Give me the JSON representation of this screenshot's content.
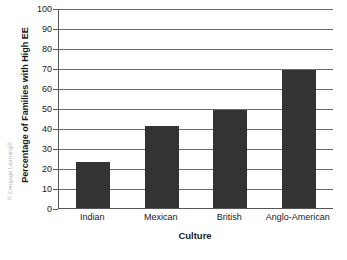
{
  "figure": {
    "credit": "© Cengage Learning®",
    "bar_color": "#333333",
    "gridline_color": "#6b6b6b",
    "axis_color": "#555555",
    "background": "#ffffff"
  },
  "chart_data": {
    "type": "bar",
    "title": "",
    "xlabel": "Culture",
    "ylabel": "Percentage of Families with High EE",
    "categories": [
      "Indian",
      "Mexican",
      "British",
      "Anglo-American"
    ],
    "values": [
      23,
      41,
      49,
      69
    ],
    "ylim": [
      0,
      100
    ],
    "yticks": [
      0,
      10,
      20,
      30,
      40,
      50,
      60,
      70,
      80,
      90,
      100
    ],
    "ytick_labels": [
      "0",
      "10",
      "20",
      "30",
      "40",
      "50",
      "60",
      "70",
      "80",
      "90",
      "100"
    ],
    "grid": true,
    "grid_axis": "y",
    "legend": false,
    "legend_position": "none"
  }
}
